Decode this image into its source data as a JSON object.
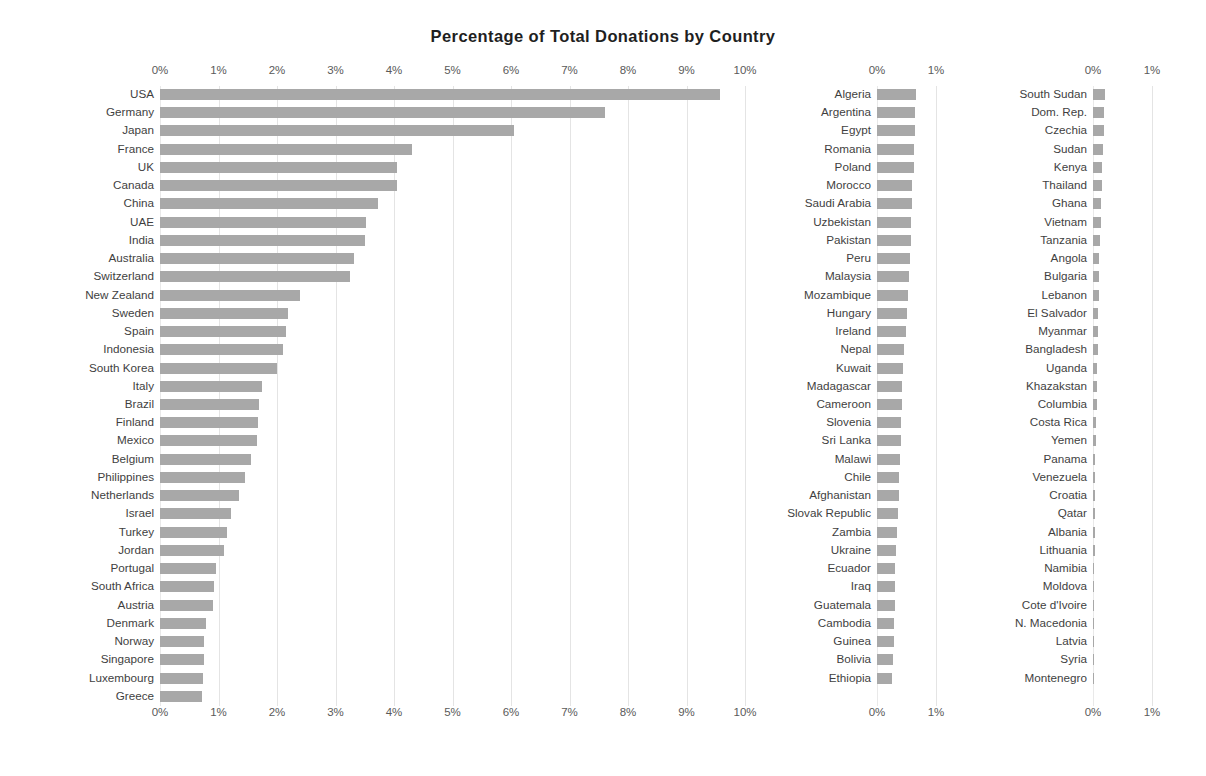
{
  "chart_data": {
    "type": "bar",
    "title": "Percentage of Total Donations by Country",
    "xlabel": "",
    "ylabel": "",
    "orientation": "horizontal",
    "grid": true,
    "legend": false,
    "value_unit": "percent",
    "panels": [
      {
        "name": "panel-left",
        "xlim": [
          0,
          10
        ],
        "ticks": [
          "0%",
          "1%",
          "2%",
          "3%",
          "4%",
          "5%",
          "6%",
          "7%",
          "8%",
          "9%",
          "10%"
        ],
        "tick_values": [
          0,
          1,
          2,
          3,
          4,
          5,
          6,
          7,
          8,
          9,
          10
        ],
        "categories": [
          "USA",
          "Germany",
          "Japan",
          "France",
          "UK",
          "Canada",
          "China",
          "UAE",
          "India",
          "Australia",
          "Switzerland",
          "New Zealand",
          "Sweden",
          "Spain",
          "Indonesia",
          "South Korea",
          "Italy",
          "Brazil",
          "Finland",
          "Mexico",
          "Belgium",
          "Philippines",
          "Netherlands",
          "Israel",
          "Turkey",
          "Jordan",
          "Portugal",
          "South Africa",
          "Austria",
          "Denmark",
          "Norway",
          "Singapore",
          "Luxembourg",
          "Greece"
        ],
        "values": [
          9.57,
          7.6,
          6.05,
          4.3,
          4.05,
          4.05,
          3.73,
          3.52,
          3.5,
          3.32,
          3.25,
          2.4,
          2.18,
          2.15,
          2.1,
          2.0,
          1.75,
          1.7,
          1.68,
          1.65,
          1.55,
          1.45,
          1.35,
          1.22,
          1.15,
          1.1,
          0.95,
          0.92,
          0.9,
          0.78,
          0.75,
          0.75,
          0.73,
          0.72
        ]
      },
      {
        "name": "panel-middle",
        "xlim": [
          0,
          1
        ],
        "ticks": [
          "0%",
          "1%"
        ],
        "tick_values": [
          0,
          1
        ],
        "categories": [
          "Algeria",
          "Argentina",
          "Egypt",
          "Romania",
          "Poland",
          "Morocco",
          "Saudi Arabia",
          "Uzbekistan",
          "Pakistan",
          "Peru",
          "Malaysia",
          "Mozambique",
          "Hungary",
          "Ireland",
          "Nepal",
          "Kuwait",
          "Madagascar",
          "Cameroon",
          "Slovenia",
          "Sri Lanka",
          "Malawi",
          "Chile",
          "Afghanistan",
          "Slovak Republic",
          "Zambia",
          "Ukraine",
          "Ecuador",
          "Iraq",
          "Guatemala",
          "Cambodia",
          "Guinea",
          "Bolivia",
          "Ethiopia"
        ],
        "values": [
          0.66,
          0.65,
          0.64,
          0.63,
          0.62,
          0.6,
          0.59,
          0.58,
          0.57,
          0.56,
          0.54,
          0.53,
          0.5,
          0.49,
          0.45,
          0.44,
          0.43,
          0.42,
          0.41,
          0.4,
          0.39,
          0.38,
          0.37,
          0.35,
          0.34,
          0.33,
          0.31,
          0.3,
          0.3,
          0.29,
          0.28,
          0.27,
          0.26
        ]
      },
      {
        "name": "panel-right",
        "xlim": [
          0,
          1
        ],
        "ticks": [
          "0%",
          "1%"
        ],
        "tick_values": [
          0,
          1
        ],
        "categories": [
          "South Sudan",
          "Dom. Rep.",
          "Czechia",
          "Sudan",
          "Kenya",
          "Thailand",
          "Ghana",
          "Vietnam",
          "Tanzania",
          "Angola",
          "Bulgaria",
          "Lebanon",
          "El Salvador",
          "Myanmar",
          "Bangladesh",
          "Uganda",
          "Khazakstan",
          "Columbia",
          "Costa Rica",
          "Yemen",
          "Panama",
          "Venezuela",
          "Croatia",
          "Qatar",
          "Albania",
          "Lithuania",
          "Namibia",
          "Moldova",
          "Cote d'Ivoire",
          "N. Macedonia",
          "Latvia",
          "Syria",
          "Montenegro"
        ],
        "values": [
          0.2,
          0.19,
          0.18,
          0.17,
          0.16,
          0.15,
          0.14,
          0.13,
          0.12,
          0.11,
          0.1,
          0.1,
          0.09,
          0.08,
          0.08,
          0.07,
          0.06,
          0.06,
          0.05,
          0.05,
          0.04,
          0.04,
          0.04,
          0.03,
          0.03,
          0.03,
          0.02,
          0.02,
          0.02,
          0.02,
          0.01,
          0.01,
          0.01
        ]
      }
    ],
    "style": {
      "bar_color": "#a8a8a8",
      "grid_color": "#e4e4e4",
      "text_color": "#3f3f3f",
      "title_color": "#1f1f1f",
      "background": "#ffffff"
    }
  }
}
